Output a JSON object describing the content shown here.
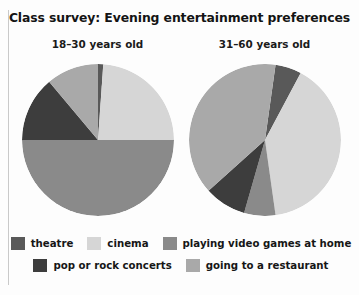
{
  "figure": {
    "title": "Class survey: Evening entertainment preferences"
  },
  "legend": {
    "rows": [
      [
        {
          "label": "theatre",
          "color": "#595959",
          "icon": "legend-swatch"
        },
        {
          "label": "cinema",
          "color": "#d6d6d6",
          "icon": "legend-swatch"
        },
        {
          "label": "playing video games at home",
          "color": "#8a8a8a",
          "icon": "legend-swatch"
        }
      ],
      [
        {
          "label": "pop or rock concerts",
          "color": "#3d3d3d",
          "icon": "legend-swatch"
        },
        {
          "label": "going to a restaurant",
          "color": "#a9a9a9",
          "icon": "legend-swatch"
        }
      ]
    ]
  },
  "chart_data": [
    {
      "type": "pie",
      "title": "18–30 years old",
      "categories": [
        "theatre",
        "cinema",
        "playing video games at home",
        "pop or rock concerts",
        "going to a restaurant"
      ],
      "values": [
        1,
        24,
        50,
        14,
        11
      ],
      "unit": "percent",
      "colors": [
        "#595959",
        "#d6d6d6",
        "#8a8a8a",
        "#3d3d3d",
        "#a9a9a9"
      ],
      "start_angle_deg": 0,
      "direction": "clockwise",
      "legend": "bottom",
      "grid": false,
      "boundaries_deg": [
        0,
        4,
        90,
        270,
        320,
        360
      ]
    },
    {
      "type": "pie",
      "title": "31–60 years old",
      "categories": [
        "theatre",
        "cinema",
        "playing video games at home",
        "pop or rock concerts",
        "going to a restaurant"
      ],
      "values": [
        6,
        40,
        39,
        9,
        6
      ],
      "unit": "percent",
      "colors": [
        "#595959",
        "#d6d6d6",
        "#8a8a8a",
        "#3d3d3d",
        "#a9a9a9"
      ],
      "start_angle_deg": 8,
      "direction": "clockwise",
      "legend": "bottom",
      "grid": false,
      "boundaries_deg": [
        8,
        28,
        172,
        196,
        228,
        368
      ]
    }
  ]
}
